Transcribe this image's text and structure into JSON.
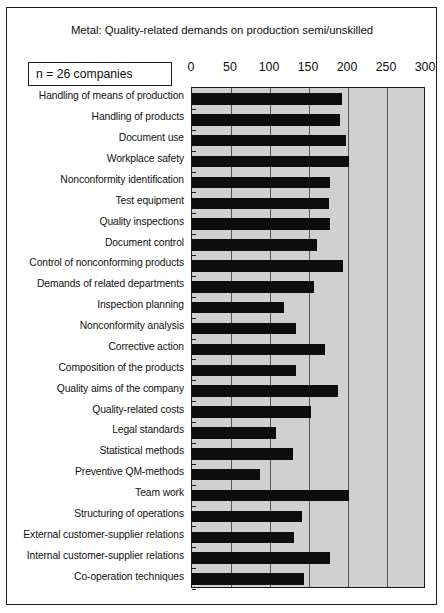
{
  "figure": {
    "title": "Metal: Quality-related demands on production semi/unskilled",
    "sample_note": "n = 26 companies"
  },
  "chart_data": {
    "type": "bar",
    "orientation": "horizontal",
    "title": "Metal: Quality-related demands on production semi/unskilled",
    "annotation": "n = 26 companies",
    "xlabel": "",
    "ylabel": "",
    "xlim": [
      0,
      300
    ],
    "xticks": [
      0,
      50,
      100,
      150,
      200,
      250,
      300
    ],
    "xtick_labels": [
      "0",
      "50",
      "100",
      "150",
      "200",
      "250",
      "300"
    ],
    "grid": true,
    "legend": false,
    "axis_position": "top",
    "plot_bgcolor": "#d0d0d0",
    "bar_color": "#0d0d0d",
    "categories": [
      "Handling of means of production",
      "Handling of products",
      "Document use",
      "Workplace safety",
      "Nonconformity identification",
      "Test equipment",
      "Quality inspections",
      "Document control",
      "Control of nonconforming products",
      "Demands of related departments",
      "Inspection planning",
      "Nonconformity analysis",
      "Corrective action",
      "Composition of the  products",
      "Quality aims of the company",
      "Quality-related costs",
      "Legal standards",
      "Statistical methods",
      "Preventive QM-methods",
      "Team work",
      "Structuring of operations",
      "External customer-supplier relations",
      "Internal customer-supplier relations",
      "Co-operation techniques"
    ],
    "values": [
      192,
      190,
      197,
      201,
      177,
      175,
      177,
      160,
      193,
      156,
      118,
      133,
      170,
      133,
      187,
      152,
      108,
      129,
      87,
      201,
      141,
      131,
      177,
      144
    ]
  }
}
